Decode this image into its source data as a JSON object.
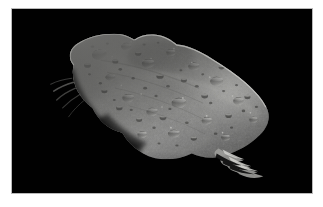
{
  "page": {
    "background_color": "#ffffff",
    "border_color": "#b9b9b9"
  },
  "photo": {
    "name": "asteroid-photograph",
    "alt_text": "Asteroid 243 Ida photographed against black space",
    "background_color": "#010101",
    "frame": {
      "x": 11,
      "y": 8,
      "width": 302,
      "height": 186
    }
  },
  "subject": {
    "label": "asteroid-body",
    "description": "Elongated, heavily cratered rocky body lit from the upper right, running diagonally from upper left to lower right",
    "body_light_color": "#b9b9b6",
    "body_mid_color": "#8e8e8b",
    "body_dark_color": "#4a4a48",
    "highlight_color": "#d8d8d4",
    "shadow_color": "#101010",
    "terminator_color": "#1b1b1b"
  },
  "features": {
    "craters_label": "impact-craters",
    "ridge_label": "central-ridge",
    "shadow_label": "terminator-shadow",
    "streaks_label": "limb-striations"
  }
}
